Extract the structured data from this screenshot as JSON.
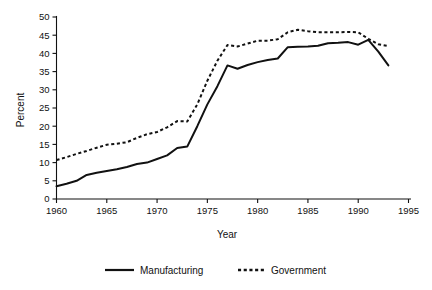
{
  "chart_data": {
    "type": "line",
    "title": "",
    "xlabel": "Year",
    "ylabel": "Percent",
    "xlim": [
      1960,
      1995
    ],
    "ylim": [
      0,
      50
    ],
    "xticks": [
      1960,
      1965,
      1970,
      1975,
      1980,
      1985,
      1990,
      1995
    ],
    "yticks": [
      0,
      5,
      10,
      15,
      20,
      25,
      30,
      35,
      40,
      45,
      50
    ],
    "grid": false,
    "legend_position": "bottom",
    "x": [
      1960,
      1961,
      1962,
      1963,
      1964,
      1965,
      1966,
      1967,
      1968,
      1969,
      1970,
      1971,
      1972,
      1973,
      1974,
      1975,
      1976,
      1977,
      1978,
      1979,
      1980,
      1981,
      1982,
      1983,
      1984,
      1985,
      1986,
      1987,
      1988,
      1989,
      1990,
      1991,
      1992,
      1993
    ],
    "series": [
      {
        "name": "Manufacturing",
        "style": "solid",
        "color": "#111111",
        "values": [
          3.5,
          4.2,
          5.0,
          6.6,
          7.2,
          7.7,
          8.2,
          8.8,
          9.6,
          10.0,
          11.0,
          12.0,
          14.0,
          14.4,
          20.0,
          26.0,
          31.0,
          36.7,
          35.8,
          36.8,
          37.6,
          38.2,
          38.6,
          41.7,
          41.8,
          41.9,
          42.1,
          42.8,
          42.9,
          43.1,
          42.4,
          43.7,
          40.5,
          36.7
        ]
      },
      {
        "name": "Government",
        "style": "dotted",
        "color": "#111111",
        "values": [
          10.7,
          11.5,
          12.4,
          13.2,
          14.1,
          14.9,
          15.2,
          15.6,
          16.8,
          17.8,
          18.4,
          19.7,
          21.4,
          21.3,
          26.0,
          32.5,
          38.0,
          42.3,
          41.9,
          42.7,
          43.5,
          43.5,
          43.9,
          45.8,
          46.5,
          46.1,
          45.8,
          45.8,
          45.8,
          45.9,
          45.8,
          44.0,
          42.5,
          42.0
        ]
      }
    ],
    "legend": [
      {
        "label": "Manufacturing",
        "style": "solid"
      },
      {
        "label": "Government",
        "style": "dotted"
      }
    ]
  },
  "plot": {
    "x_axis_name": "year-axis",
    "y_axis_name": "percent-axis"
  }
}
